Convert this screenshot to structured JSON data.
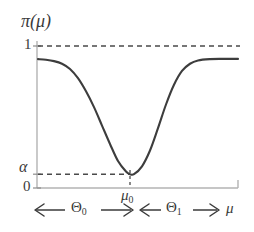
{
  "chart_data": {
    "type": "line",
    "title": "",
    "ylabel": "π(μ)",
    "xlabel": "μ",
    "xlim": [
      0,
      1
    ],
    "ylim": [
      0,
      1.08
    ],
    "grid": false,
    "legend": null,
    "y_ticks": [
      {
        "value": 1,
        "label": "1"
      },
      {
        "value": 0.105,
        "label": "α"
      },
      {
        "value": 0,
        "label": "0"
      }
    ],
    "x_ticks": [
      {
        "value": 0.46,
        "label": "μ",
        "sub": "0"
      }
    ],
    "series": [
      {
        "name": "power function",
        "x": [
          0.0,
          0.04,
          0.08,
          0.12,
          0.16,
          0.2,
          0.24,
          0.28,
          0.32,
          0.36,
          0.4,
          0.44,
          0.46,
          0.48,
          0.52,
          0.56,
          0.6,
          0.64,
          0.68,
          0.72,
          0.76,
          0.8,
          0.86,
          0.92,
          1.0
        ],
        "y": [
          0.98,
          0.975,
          0.965,
          0.945,
          0.905,
          0.835,
          0.735,
          0.615,
          0.475,
          0.335,
          0.205,
          0.125,
          0.105,
          0.105,
          0.165,
          0.285,
          0.455,
          0.635,
          0.785,
          0.89,
          0.945,
          0.97,
          0.98,
          0.982,
          0.982
        ]
      }
    ],
    "annotations": [
      {
        "name": "upper-asymptote",
        "type": "dashed-horizontal",
        "y": 1,
        "label": "1"
      },
      {
        "name": "alpha-level",
        "type": "dashed-horizontal",
        "y": 0.105,
        "label": "α"
      },
      {
        "name": "mu0-drop",
        "type": "dashed-vertical",
        "x": 0.46,
        "label": "μ0"
      },
      {
        "name": "theta0-span",
        "type": "double-arrow",
        "label": "Θ",
        "sub": "0",
        "from": 0.0,
        "to": 0.47
      },
      {
        "name": "theta1-span",
        "type": "double-arrow",
        "label": "Θ",
        "sub": "1",
        "from": 0.5,
        "to": 0.9
      }
    ]
  },
  "axes": {
    "y_title": "π(μ)",
    "y_tick_one": "1",
    "y_tick_alpha": "α",
    "y_tick_zero": "0",
    "x_tick_mu0_base": "μ",
    "x_tick_mu0_sub": "0",
    "x_axis_label": "μ"
  },
  "ranges": {
    "theta0_base": "Θ",
    "theta0_sub": "0",
    "theta1_base": "Θ",
    "theta1_sub": "1"
  },
  "colors": {
    "curve": "#3d3d3d",
    "axis": "#b3b3b3",
    "dashed": "#4a4a4a",
    "text": "#3a3a3a",
    "background": "#ffffff"
  }
}
